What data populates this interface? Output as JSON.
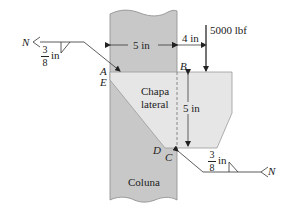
{
  "diagram": {
    "type": "welded-bracket",
    "column": {
      "label": "Coluna",
      "width_label": "5 in",
      "fill": "#c8c8c8"
    },
    "plate": {
      "label_line1": "Chapa",
      "label_line2": "lateral",
      "height_label": "5 in",
      "fill": "#e6e6e6"
    },
    "load": {
      "label": "5000 lbf",
      "offset_label": "4 in"
    },
    "points": {
      "A": "A",
      "E": "E",
      "B": "B",
      "C": "C",
      "D": "D"
    },
    "welds": [
      {
        "position": "upper-left",
        "size_num": "3",
        "size_den": "8",
        "size_unit": "in",
        "tail": "N",
        "symbol": "fillet"
      },
      {
        "position": "lower-right",
        "size_num": "3",
        "size_den": "8",
        "size_unit": "in",
        "tail": "N",
        "symbol": "fillet"
      }
    ]
  }
}
